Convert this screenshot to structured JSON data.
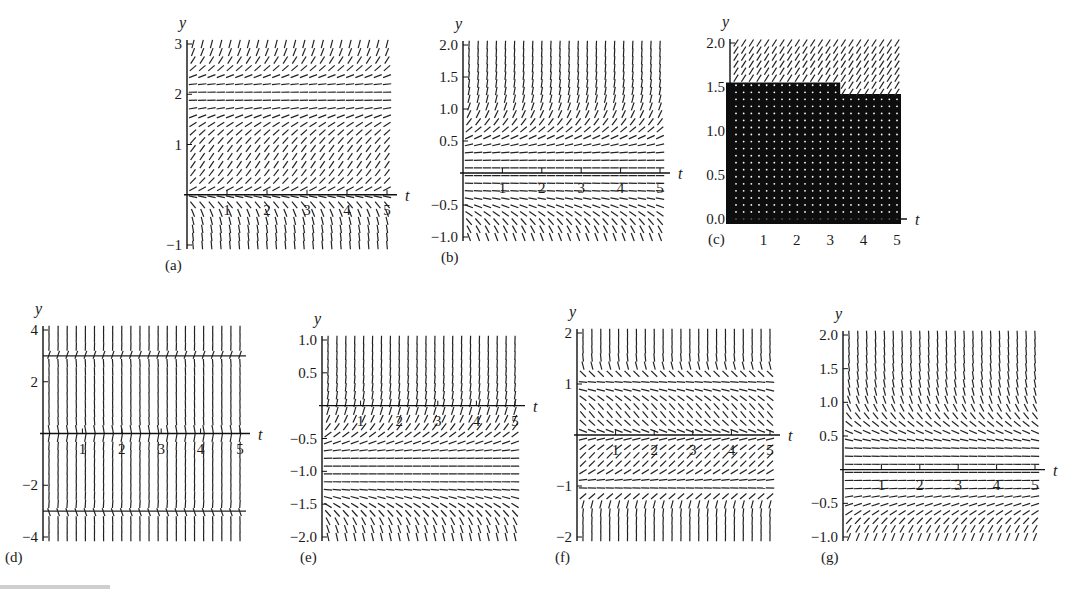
{
  "figure": {
    "panel_labels": [
      "(a)",
      "(b)",
      "(c)",
      "(d)",
      "(e)",
      "(f)",
      "(g)"
    ],
    "axis_labels": {
      "x": "t",
      "y": "y"
    }
  },
  "chart_data": [
    {
      "id": "a",
      "type": "slope-field",
      "label": "(a)",
      "xlabel": "t",
      "ylabel": "y",
      "xlim": [
        0,
        5
      ],
      "ylim": [
        -1,
        3
      ],
      "xticks": [
        1,
        2,
        3,
        4,
        5
      ],
      "yticks": [
        -1,
        1,
        2,
        3
      ],
      "ytick_labels": [
        "−1",
        "1",
        "2",
        "3"
      ],
      "equilibria": [
        0,
        2
      ],
      "slope_fn": "y*(y-2)*(y-2)",
      "frame": {
        "x0": 187,
        "y_top": 44,
        "y_bot": 245,
        "x5": 387
      }
    },
    {
      "id": "b",
      "type": "slope-field",
      "label": "(b)",
      "xlabel": "t",
      "ylabel": "y",
      "xlim": [
        0,
        5
      ],
      "ylim": [
        -1,
        2
      ],
      "xticks": [
        1,
        2,
        3,
        4,
        5
      ],
      "yticks": [
        -1.0,
        -0.5,
        0.5,
        1.0,
        1.5,
        2.0
      ],
      "ytick_labels": [
        "−1.0",
        "−0.5",
        "0.5",
        "1.0",
        "1.5",
        "2.0"
      ],
      "equilibria": [
        0
      ],
      "slope_fn": "y*y*y*1.6",
      "frame": {
        "x0": 463,
        "y_top": 45,
        "y_bot": 237,
        "x5": 660
      }
    },
    {
      "id": "c",
      "type": "slope-field",
      "label": "(c)",
      "xlabel": "t",
      "ylabel": "y",
      "xlim": [
        0,
        5
      ],
      "ylim": [
        0,
        2
      ],
      "xticks": [
        1,
        2,
        3,
        4,
        5
      ],
      "yticks": [
        0.0,
        0.5,
        1.0,
        1.5,
        2.0
      ],
      "ytick_labels": [
        "0.0",
        "0.5",
        "1.0",
        "1.5",
        "2.0"
      ],
      "filled_region": {
        "y_max_left": 1.55,
        "y_max_right": 1.42,
        "step_at_t": 3.3
      },
      "slope_fn": "0.6",
      "frame": {
        "x0": 730,
        "y_top": 43,
        "y_bot": 219,
        "x5": 897
      }
    },
    {
      "id": "d",
      "type": "slope-field",
      "label": "(d)",
      "xlabel": "t",
      "ylabel": "y",
      "xlim": [
        0,
        5
      ],
      "ylim": [
        -4,
        4
      ],
      "xticks": [
        1,
        2,
        3,
        4,
        5
      ],
      "yticks": [
        -4,
        -2,
        2,
        4
      ],
      "ytick_labels": [
        "−4",
        "−2",
        "2",
        "4"
      ],
      "equilibria": [
        -3,
        0,
        3
      ],
      "slope_fn": "-6*y*(9-y*y)",
      "frame": {
        "x0": 43,
        "y_top": 330,
        "y_bot": 537,
        "x5": 240
      }
    },
    {
      "id": "e",
      "type": "slope-field",
      "label": "(e)",
      "xlabel": "t",
      "ylabel": "y",
      "xlim": [
        0,
        5
      ],
      "ylim": [
        -2,
        1
      ],
      "xticks": [
        1,
        2,
        3,
        4,
        5
      ],
      "yticks": [
        -2.0,
        -1.5,
        -1.0,
        -0.5,
        0.5,
        1.0
      ],
      "ytick_labels": [
        "−2.0",
        "−1.5",
        "−1.0",
        "−0.5",
        "0.5",
        "1.0"
      ],
      "equilibria": [
        -1
      ],
      "slope_fn": "(y+1)*(y+1)*(y+1)*2.5",
      "frame": {
        "x0": 322,
        "y_top": 340,
        "y_bot": 537,
        "x5": 515
      }
    },
    {
      "id": "f",
      "type": "slope-field",
      "label": "(f)",
      "xlabel": "t",
      "ylabel": "y",
      "xlim": [
        0,
        5
      ],
      "ylim": [
        -2,
        2
      ],
      "xticks": [
        1,
        2,
        3,
        4,
        5
      ],
      "yticks": [
        -2,
        -1,
        1,
        2
      ],
      "ytick_labels": [
        "−2",
        "−1",
        "1",
        "2"
      ],
      "equilibria": [
        -1,
        1
      ],
      "slope_fn": "-(y*y-1)*(y*y-1)*y*3-0.05",
      "frame": {
        "x0": 577,
        "y_top": 333,
        "y_bot": 537,
        "x5": 770
      }
    },
    {
      "id": "g",
      "type": "slope-field",
      "label": "(g)",
      "xlabel": "t",
      "ylabel": "y",
      "xlim": [
        0,
        5
      ],
      "ylim": [
        -1,
        2
      ],
      "xticks": [
        1,
        2,
        3,
        4,
        5
      ],
      "yticks": [
        -1.0,
        -0.5,
        0.5,
        1.0,
        1.5,
        2.0
      ],
      "ytick_labels": [
        "−1.0",
        "−0.5",
        "0.5",
        "1.0",
        "1.5",
        "2.0"
      ],
      "equilibria": [
        0,
        1
      ],
      "slope_fn": "-y*y*y*1.4",
      "frame": {
        "x0": 843,
        "y_top": 335,
        "y_bot": 537,
        "x5": 1035
      }
    }
  ]
}
